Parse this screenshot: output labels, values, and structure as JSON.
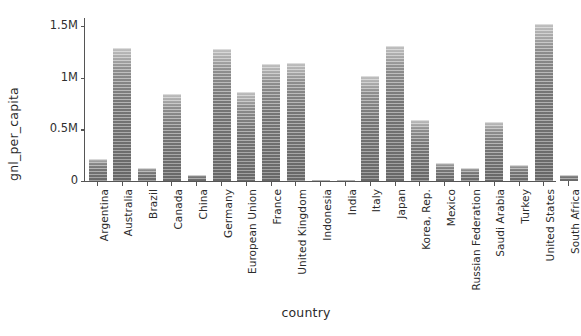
{
  "chart_data": {
    "type": "bar",
    "title": "",
    "xlabel": "country",
    "ylabel": "gnl_per_capita",
    "ylim": [
      0,
      1600000
    ],
    "grid": false,
    "legend": null,
    "ytick_labels": [
      "0",
      "0.5M",
      "1M",
      "1.5M"
    ],
    "ytick_values": [
      0,
      500000,
      1000000,
      1500000
    ],
    "categories": [
      "Argentina",
      "Australia",
      "Brazil",
      "Canada",
      "China",
      "Germany",
      "European Union",
      "France",
      "United Kingdom",
      "Indonesia",
      "India",
      "Italy",
      "Japan",
      "Korea, Rep.",
      "Mexico",
      "Russian Federation",
      "Saudi Arabia",
      "Turkey",
      "United States",
      "South Africa"
    ],
    "values": [
      210000,
      1285000,
      125000,
      840000,
      55000,
      1280000,
      860000,
      1135000,
      1145000,
      10000,
      10000,
      1015000,
      1310000,
      590000,
      170000,
      130000,
      570000,
      155000,
      1520000,
      60000
    ],
    "bar_color": "#8c8c8c"
  },
  "axes": {
    "y_label": "gnl_per_capita",
    "x_label": "country"
  }
}
